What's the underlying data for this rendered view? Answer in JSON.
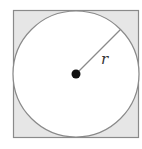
{
  "diagram": {
    "square": {
      "x": 13,
      "y": 10,
      "size": 126,
      "fill": "#e6e6e6",
      "stroke": "#8a8a8a"
    },
    "circle": {
      "cx": 76,
      "cy": 73,
      "r": 63,
      "fill": "#ffffff",
      "stroke": "#8a8a8a"
    },
    "center_point": {
      "cx": 76,
      "cy": 73,
      "r": 4,
      "fill": "#111111"
    },
    "radius_line": {
      "x1": 76,
      "y1": 73,
      "x2": 120.5,
      "y2": 28.5,
      "stroke": "#8a8a8a"
    },
    "radius_label": "r"
  }
}
